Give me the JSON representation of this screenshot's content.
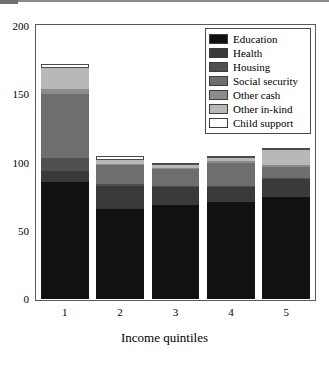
{
  "chart_data": {
    "type": "bar",
    "subtype": "stacked-bar",
    "title": "",
    "xlabel": "Income quintiles",
    "ylabel": "",
    "categories": [
      "1",
      "2",
      "3",
      "4",
      "5"
    ],
    "ylim": [
      0,
      200
    ],
    "yticks": [
      0,
      50,
      100,
      150,
      200
    ],
    "ytick_labels": [
      "0",
      "50",
      "100",
      "150",
      "200"
    ],
    "grid": false,
    "legend_position": "top-right",
    "series": [
      {
        "name": "Education",
        "color": "#111111",
        "values": [
          86,
          66,
          69,
          71,
          75
        ]
      },
      {
        "name": "Health",
        "color": "#3a3a3a",
        "values": [
          8,
          17,
          13,
          11,
          13
        ]
      },
      {
        "name": "Housing",
        "color": "#4f4f4f",
        "values": [
          9,
          1,
          1,
          1,
          1
        ]
      },
      {
        "name": "Social security",
        "color": "#6e6e6e",
        "values": [
          47,
          14,
          12,
          17,
          8
        ]
      },
      {
        "name": "Other cash",
        "color": "#8c8c8c",
        "values": [
          4,
          1,
          1,
          1,
          1
        ]
      },
      {
        "name": "Other in-kind",
        "color": "#b8b8b8",
        "values": [
          15,
          3,
          2,
          2,
          11
        ]
      },
      {
        "name": "Child support",
        "color": "#ffffff",
        "values": [
          3,
          3,
          2,
          2,
          2
        ]
      }
    ],
    "totals": [
      172,
      105,
      100,
      105,
      111
    ]
  },
  "legend": {
    "items": [
      {
        "label": "Education"
      },
      {
        "label": "Health"
      },
      {
        "label": "Housing"
      },
      {
        "label": "Social security"
      },
      {
        "label": "Other cash"
      },
      {
        "label": "Other in-kind"
      },
      {
        "label": "Child support"
      }
    ]
  }
}
